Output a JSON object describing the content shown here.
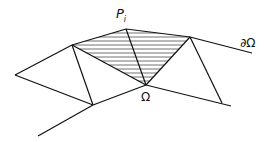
{
  "diagram": {
    "labels": {
      "vertex": "P",
      "vertex_sub": "i",
      "domain": "Ω",
      "boundary": "∂Ω"
    },
    "colors": {
      "stroke": "#111111",
      "background": "#ffffff"
    }
  }
}
